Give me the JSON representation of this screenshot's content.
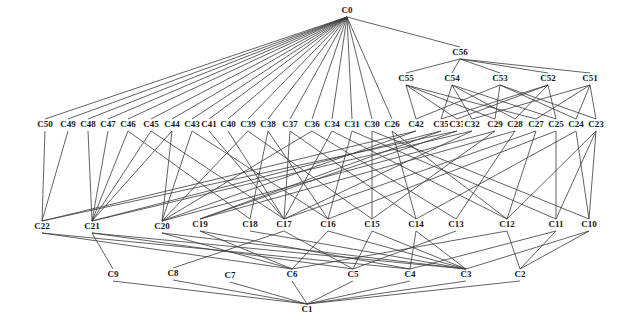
{
  "diagram": {
    "type": "lattice",
    "nodes": [
      {
        "id": "C0",
        "x": 347,
        "y": 13
      },
      {
        "id": "C56",
        "x": 460,
        "y": 55
      },
      {
        "id": "C55",
        "x": 406,
        "y": 81
      },
      {
        "id": "C54",
        "x": 452,
        "y": 81
      },
      {
        "id": "C53",
        "x": 500,
        "y": 81
      },
      {
        "id": "C52",
        "x": 548,
        "y": 81
      },
      {
        "id": "C51",
        "x": 590,
        "y": 81
      },
      {
        "id": "C50",
        "x": 45,
        "y": 127
      },
      {
        "id": "C49",
        "x": 68,
        "y": 127
      },
      {
        "id": "C48",
        "x": 88,
        "y": 127
      },
      {
        "id": "C47",
        "x": 108,
        "y": 127
      },
      {
        "id": "C46",
        "x": 128,
        "y": 127
      },
      {
        "id": "C45",
        "x": 151,
        "y": 127
      },
      {
        "id": "C44",
        "x": 172,
        "y": 127
      },
      {
        "id": "C43",
        "x": 192,
        "y": 127
      },
      {
        "id": "C41",
        "x": 209,
        "y": 127
      },
      {
        "id": "C40",
        "x": 228,
        "y": 127
      },
      {
        "id": "C39",
        "x": 248,
        "y": 127
      },
      {
        "id": "C38",
        "x": 268,
        "y": 127
      },
      {
        "id": "C37",
        "x": 290,
        "y": 127
      },
      {
        "id": "C36",
        "x": 312,
        "y": 127
      },
      {
        "id": "C34",
        "x": 332,
        "y": 127
      },
      {
        "id": "C31",
        "x": 352,
        "y": 127
      },
      {
        "id": "C30",
        "x": 372,
        "y": 127
      },
      {
        "id": "C26",
        "x": 392,
        "y": 127
      },
      {
        "id": "C42",
        "x": 416,
        "y": 127
      },
      {
        "id": "C35",
        "x": 441,
        "y": 127
      },
      {
        "id": "C33",
        "x": 457,
        "y": 127
      },
      {
        "id": "C32",
        "x": 472,
        "y": 127
      },
      {
        "id": "C29",
        "x": 495,
        "y": 127
      },
      {
        "id": "C28",
        "x": 515,
        "y": 127
      },
      {
        "id": "C27",
        "x": 536,
        "y": 127
      },
      {
        "id": "C25",
        "x": 556,
        "y": 127
      },
      {
        "id": "C24",
        "x": 576,
        "y": 127
      },
      {
        "id": "C23",
        "x": 596,
        "y": 127
      },
      {
        "id": "C22",
        "x": 42,
        "y": 229
      },
      {
        "id": "C21",
        "x": 92,
        "y": 229
      },
      {
        "id": "C20",
        "x": 162,
        "y": 229
      },
      {
        "id": "C19",
        "x": 200,
        "y": 227
      },
      {
        "id": "C18",
        "x": 250,
        "y": 227
      },
      {
        "id": "C17",
        "x": 284,
        "y": 227
      },
      {
        "id": "C16",
        "x": 328,
        "y": 227
      },
      {
        "id": "C15",
        "x": 372,
        "y": 227
      },
      {
        "id": "C14",
        "x": 416,
        "y": 227
      },
      {
        "id": "C13",
        "x": 456,
        "y": 227
      },
      {
        "id": "C12",
        "x": 507,
        "y": 227
      },
      {
        "id": "C11",
        "x": 556,
        "y": 227
      },
      {
        "id": "C10",
        "x": 589,
        "y": 227
      },
      {
        "id": "C9",
        "x": 113,
        "y": 277
      },
      {
        "id": "C8",
        "x": 173,
        "y": 276
      },
      {
        "id": "C7",
        "x": 230,
        "y": 278
      },
      {
        "id": "C6",
        "x": 292,
        "y": 277
      },
      {
        "id": "C5",
        "x": 353,
        "y": 277
      },
      {
        "id": "C4",
        "x": 410,
        "y": 277
      },
      {
        "id": "C3",
        "x": 466,
        "y": 277
      },
      {
        "id": "C2",
        "x": 520,
        "y": 277
      },
      {
        "id": "C1",
        "x": 307,
        "y": 312
      }
    ],
    "edges": [
      [
        "C0",
        "C50"
      ],
      [
        "C0",
        "C49"
      ],
      [
        "C0",
        "C48"
      ],
      [
        "C0",
        "C47"
      ],
      [
        "C0",
        "C46"
      ],
      [
        "C0",
        "C45"
      ],
      [
        "C0",
        "C44"
      ],
      [
        "C0",
        "C43"
      ],
      [
        "C0",
        "C41"
      ],
      [
        "C0",
        "C40"
      ],
      [
        "C0",
        "C39"
      ],
      [
        "C0",
        "C38"
      ],
      [
        "C0",
        "C37"
      ],
      [
        "C0",
        "C36"
      ],
      [
        "C0",
        "C34"
      ],
      [
        "C0",
        "C31"
      ],
      [
        "C0",
        "C30"
      ],
      [
        "C0",
        "C26"
      ],
      [
        "C0",
        "C56"
      ],
      [
        "C56",
        "C55"
      ],
      [
        "C56",
        "C54"
      ],
      [
        "C56",
        "C53"
      ],
      [
        "C56",
        "C52"
      ],
      [
        "C56",
        "C51"
      ],
      [
        "C55",
        "C42"
      ],
      [
        "C55",
        "C33"
      ],
      [
        "C55",
        "C29"
      ],
      [
        "C55",
        "C27"
      ],
      [
        "C54",
        "C35"
      ],
      [
        "C54",
        "C32"
      ],
      [
        "C54",
        "C28"
      ],
      [
        "C54",
        "C25"
      ],
      [
        "C53",
        "C42"
      ],
      [
        "C53",
        "C29"
      ],
      [
        "C53",
        "C24"
      ],
      [
        "C53",
        "C23"
      ],
      [
        "C52",
        "C35"
      ],
      [
        "C52",
        "C33"
      ],
      [
        "C52",
        "C28"
      ],
      [
        "C52",
        "C25"
      ],
      [
        "C51",
        "C32"
      ],
      [
        "C51",
        "C27"
      ],
      [
        "C51",
        "C24"
      ],
      [
        "C51",
        "C23"
      ],
      [
        "C50",
        "C22"
      ],
      [
        "C49",
        "C22"
      ],
      [
        "C48",
        "C21"
      ],
      [
        "C47",
        "C21"
      ],
      [
        "C46",
        "C21"
      ],
      [
        "C46",
        "C18"
      ],
      [
        "C45",
        "C21"
      ],
      [
        "C45",
        "C17"
      ],
      [
        "C44",
        "C20"
      ],
      [
        "C44",
        "C21"
      ],
      [
        "C43",
        "C20"
      ],
      [
        "C43",
        "C16"
      ],
      [
        "C41",
        "C17"
      ],
      [
        "C40",
        "C17"
      ],
      [
        "C39",
        "C20"
      ],
      [
        "C39",
        "C15"
      ],
      [
        "C38",
        "C18"
      ],
      [
        "C38",
        "C16"
      ],
      [
        "C37",
        "C17"
      ],
      [
        "C37",
        "C14"
      ],
      [
        "C36",
        "C20"
      ],
      [
        "C36",
        "C13"
      ],
      [
        "C34",
        "C17"
      ],
      [
        "C34",
        "C12"
      ],
      [
        "C31",
        "C16"
      ],
      [
        "C31",
        "C11"
      ],
      [
        "C30",
        "C15"
      ],
      [
        "C30",
        "C10"
      ],
      [
        "C26",
        "C14"
      ],
      [
        "C26",
        "C12"
      ],
      [
        "C42",
        "C22"
      ],
      [
        "C42",
        "C20"
      ],
      [
        "C35",
        "C21"
      ],
      [
        "C35",
        "C19"
      ],
      [
        "C33",
        "C22"
      ],
      [
        "C33",
        "C19"
      ],
      [
        "C32",
        "C21"
      ],
      [
        "C32",
        "C17"
      ],
      [
        "C29",
        "C20"
      ],
      [
        "C29",
        "C15"
      ],
      [
        "C28",
        "C19"
      ],
      [
        "C28",
        "C13"
      ],
      [
        "C27",
        "C17"
      ],
      [
        "C27",
        "C12"
      ],
      [
        "C25",
        "C16"
      ],
      [
        "C25",
        "C11"
      ],
      [
        "C24",
        "C14"
      ],
      [
        "C24",
        "C10"
      ],
      [
        "C23",
        "C12"
      ],
      [
        "C23",
        "C11"
      ],
      [
        "C23",
        "C10"
      ],
      [
        "C22",
        "C6"
      ],
      [
        "C22",
        "C4"
      ],
      [
        "C21",
        "C9"
      ],
      [
        "C21",
        "C5"
      ],
      [
        "C21",
        "C3"
      ],
      [
        "C20",
        "C6"
      ],
      [
        "C20",
        "C3"
      ],
      [
        "C19",
        "C6"
      ],
      [
        "C19",
        "C4"
      ],
      [
        "C18",
        "C3"
      ],
      [
        "C17",
        "C8"
      ],
      [
        "C17",
        "C5"
      ],
      [
        "C16",
        "C6"
      ],
      [
        "C16",
        "C3"
      ],
      [
        "C15",
        "C5"
      ],
      [
        "C15",
        "C3"
      ],
      [
        "C14",
        "C4"
      ],
      [
        "C14",
        "C3"
      ],
      [
        "C13",
        "C5"
      ],
      [
        "C12",
        "C6"
      ],
      [
        "C12",
        "C2"
      ],
      [
        "C11",
        "C4"
      ],
      [
        "C11",
        "C2"
      ],
      [
        "C10",
        "C3"
      ],
      [
        "C10",
        "C2"
      ],
      [
        "C9",
        "C1"
      ],
      [
        "C8",
        "C1"
      ],
      [
        "C7",
        "C1"
      ],
      [
        "C6",
        "C1"
      ],
      [
        "C5",
        "C1"
      ],
      [
        "C4",
        "C1"
      ],
      [
        "C3",
        "C1"
      ],
      [
        "C2",
        "C1"
      ]
    ]
  }
}
